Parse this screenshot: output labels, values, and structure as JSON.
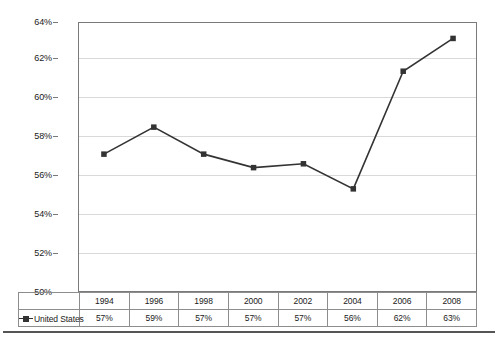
{
  "chart_data": {
    "type": "line",
    "title": "",
    "xlabel": "",
    "ylabel": "",
    "ylim": [
      50,
      64
    ],
    "ytick_step": 2,
    "ytick_labels": [
      "64%",
      "62%",
      "60%",
      "58%",
      "56%",
      "54%",
      "52%",
      "50%"
    ],
    "ytick_values": [
      64,
      62,
      60,
      58,
      56,
      54,
      52,
      50
    ],
    "grid": true,
    "legend_position": "bottom-left-table",
    "categories": [
      "1994",
      "1996",
      "1998",
      "2000",
      "2002",
      "2004",
      "2006",
      "2008"
    ],
    "series": [
      {
        "name": "United States",
        "values": [
          57.2,
          58.6,
          57.2,
          56.5,
          56.7,
          55.4,
          61.5,
          63.2
        ],
        "labels": [
          "57%",
          "59%",
          "57%",
          "57%",
          "57%",
          "56%",
          "62%",
          "63%"
        ],
        "line_color": "#333333",
        "marker": "square",
        "marker_color": "#333333"
      }
    ]
  },
  "table": {
    "header_row": [
      "1994",
      "1996",
      "1998",
      "2000",
      "2002",
      "2004",
      "2006",
      "2008"
    ],
    "series_label": "United States",
    "values_row": [
      "57%",
      "59%",
      "57%",
      "57%",
      "57%",
      "56%",
      "62%",
      "63%"
    ]
  },
  "axis": {
    "y_labels": [
      "64%",
      "62%",
      "60%",
      "58%",
      "56%",
      "54%",
      "52%",
      "50%"
    ]
  },
  "colors": {
    "line": "#333333",
    "marker": "#333333",
    "gridline": "#d9d9d9",
    "axis": "#7a7a7a",
    "table_border": "#8d8d8d",
    "text": "#1a1a1a",
    "background": "#ffffff"
  },
  "icons": {
    "legend_marker": "square-marker-icon"
  }
}
